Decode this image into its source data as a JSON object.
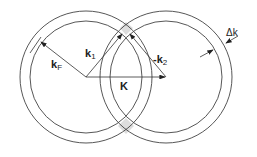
{
  "diagram": {
    "type": "fermi-sphere-scattering",
    "labels": {
      "kF": "k",
      "kF_sub": "F",
      "k1": "k",
      "k1_sub": "1",
      "k2_prefix": "-k",
      "k2_sub": "2",
      "K": "K",
      "dk": "Δk"
    },
    "circles": [
      {
        "name": "left-fermi-sphere",
        "cx": 86,
        "cy": 77,
        "r_outer": 66,
        "r_inner": 56
      },
      {
        "name": "right-fermi-sphere",
        "cx": 166,
        "cy": 77,
        "r_outer": 66,
        "r_inner": 56
      }
    ],
    "colors": {
      "line": "#333333",
      "shade": "#dddddd"
    }
  }
}
